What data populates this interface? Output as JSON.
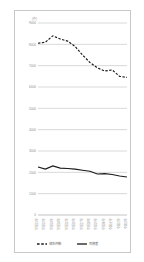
{
  "chart_data": {
    "type": "line",
    "title": "",
    "xlabel": "",
    "ylabel": "",
    "unit_label": "(件)",
    "ylim": [
      0,
      9000
    ],
    "yticks": [
      9000,
      8000,
      7000,
      6000,
      5000,
      4000,
      3000,
      2000,
      1000,
      0
    ],
    "ytick_labels": [
      "9000",
      "8000",
      "7000",
      "6000",
      "5000",
      "4000",
      "3000",
      "2000",
      "1000",
      "0"
    ],
    "grid": true,
    "legend_position": "bottom",
    "categories": [
      "平成21年",
      "平成22年",
      "平成23年",
      "平成24年",
      "平成25年",
      "平成26年",
      "平成27年",
      "平成28年",
      "平成29年",
      "平成30年",
      "令和元年",
      "令和2年",
      "令和3年"
    ],
    "series": [
      {
        "name": "発生件数",
        "style": "dashed",
        "color": "#1a1a1a",
        "values": [
          8050,
          8100,
          8400,
          8250,
          8150,
          7900,
          7500,
          7150,
          6900,
          6750,
          6800,
          6500,
          6450
        ]
      },
      {
        "name": "死傷者",
        "style": "solid",
        "color": "#1a1a1a",
        "values": [
          2250,
          2150,
          2300,
          2200,
          2180,
          2150,
          2100,
          2050,
          1920,
          1940,
          1900,
          1830,
          1780
        ]
      }
    ]
  },
  "legend": {
    "items": [
      {
        "label": "発生件数",
        "style": "dashed"
      },
      {
        "label": "死傷者",
        "style": "solid"
      }
    ]
  }
}
